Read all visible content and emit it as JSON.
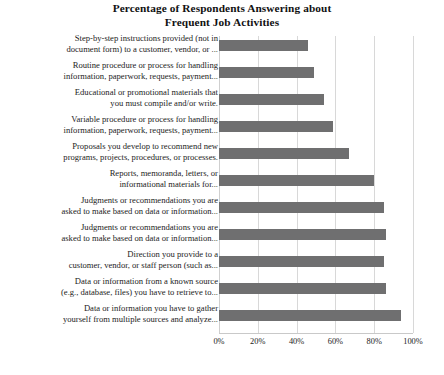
{
  "chart_data": {
    "type": "bar",
    "orientation": "horizontal",
    "title": "Percentage of Respondents Answering about Frequent Job Activities",
    "title_lines": [
      "Percentage of Respondents Answering about",
      "Frequent Job Activities"
    ],
    "xlabel": "",
    "ylabel": "",
    "xlim": [
      0,
      100
    ],
    "xticks": [
      0,
      20,
      40,
      60,
      80,
      100
    ],
    "xtick_labels": [
      "0%",
      "20%",
      "40%",
      "60%",
      "80%",
      "100%"
    ],
    "grid": true,
    "legend": false,
    "bar_color": "#6f6f70",
    "categories": [
      "Step-by-step instructions provided (not in document form) to a customer, vendor, or ...",
      "Routine procedure or process for handling information, paperwork, requests, payment...",
      "Educational or promotional materials that you must compile and/or write.",
      "Variable procedure or process for handling information, paperwork, requests, payment...",
      "Proposals you develop to recommend new programs, projects, procedures, or processes.",
      "Reports, memoranda, letters, or informational materials for...",
      "Judgments or recommendations you are asked to make based on data or information...",
      "Judgments or recommendations you are asked to make based on data or information...",
      "Direction you provide to a customer, vendor, or staff person (such as...",
      "Data or information from a known source (e.g., database, files) you have to retrieve to...",
      "Data or information you have to gather yourself from multiple sources and analyze..."
    ],
    "category_lines": [
      [
        "Step-by-step instructions provided (not in",
        "document form) to a customer, vendor, or ..."
      ],
      [
        "Routine procedure or process for handling",
        "information, paperwork, requests, payment..."
      ],
      [
        "Educational or promotional materials that",
        "you must compile and/or write."
      ],
      [
        "Variable procedure or process for handling",
        "information, paperwork, requests, payment..."
      ],
      [
        "Proposals you develop to recommend new",
        "programs, projects, procedures, or processes."
      ],
      [
        "Reports, memoranda, letters, or",
        "informational materials for..."
      ],
      [
        "Judgments or recommendations you are",
        "asked to make based on data or information..."
      ],
      [
        "Judgments or recommendations you are",
        "asked to make based on data or information..."
      ],
      [
        "Direction you provide to a",
        "customer, vendor, or staff person (such as..."
      ],
      [
        "Data or information from a known source",
        "(e.g., database, files) you have to retrieve to..."
      ],
      [
        "Data or information you have to gather",
        "yourself from multiple sources and analyze..."
      ]
    ],
    "values": [
      46,
      49,
      54,
      59,
      67,
      80,
      85,
      86,
      85,
      86,
      94
    ]
  }
}
